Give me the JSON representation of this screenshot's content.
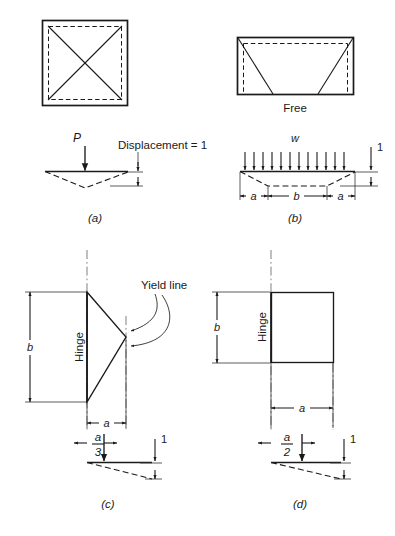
{
  "figure": {
    "panels": [
      {
        "id": "a",
        "caption": "(a)",
        "plan": {
          "shape": "square",
          "yield_pattern": "two full diagonals meeting at center",
          "edge_style": "supported on all four edges",
          "edge_labels": []
        },
        "section": {
          "load_label": "P",
          "load_type": "point load at center",
          "displacement_label": "Displacement = 1",
          "dimension_labels": []
        }
      },
      {
        "id": "b",
        "caption": "(b)",
        "plan": {
          "shape": "rectangle",
          "yield_pattern": "two inclined yield lines from top corners to bottom edge",
          "edge_style": "three edges supported, bottom edge free",
          "edge_labels": [
            "Free"
          ]
        },
        "section": {
          "load_label": "w",
          "load_type": "uniformly distributed load",
          "displacement_label": "1",
          "dimension_labels": [
            "a",
            "b",
            "a"
          ]
        }
      },
      {
        "id": "c",
        "caption": "(c)",
        "plan": {
          "shape": "triangle",
          "yield_pattern": "triangular yield line fan from hinge edge to apex",
          "edge_style": "hinged along left edge",
          "edge_labels": [
            "Hinge"
          ],
          "annotation": "Yield line",
          "dim_vertical": "b",
          "dim_horizontal": "a"
        },
        "section": {
          "centroid_numerator": "a",
          "centroid_denominator": "3",
          "displacement_label": "1"
        }
      },
      {
        "id": "d",
        "caption": "(d)",
        "plan": {
          "shape": "square",
          "yield_pattern": "rigid panel rotating about hinge edge",
          "edge_style": "hinged along left edge",
          "edge_labels": [
            "Hinge"
          ],
          "dim_vertical": "b",
          "dim_horizontal": "a"
        },
        "section": {
          "centroid_numerator": "a",
          "centroid_denominator": "2",
          "displacement_label": "1"
        }
      }
    ],
    "text": {
      "caption_a": "(a)",
      "caption_b": "(b)",
      "caption_c": "(c)",
      "caption_d": "(d)",
      "load_p": "P",
      "load_w": "w",
      "displacement_full": "Displacement = 1",
      "free_edge": "Free",
      "hinge_c": "Hinge",
      "hinge_d": "Hinge",
      "yield_line": "Yield line",
      "dim_a_left_b": "a",
      "dim_b_mid_b": "b",
      "dim_a_right_b": "a",
      "unit_one_b": "1",
      "dim_b_c": "b",
      "dim_a_c": "a",
      "frac_num_c": "a",
      "frac_den_c": "3",
      "unit_one_c": "1",
      "dim_b_d": "b",
      "dim_a_d": "a",
      "frac_num_d": "a",
      "frac_den_d": "2",
      "unit_one_d": "1"
    },
    "colors": {
      "line": "#1a1a1a",
      "thin_line": "#333333",
      "center_line": "#555555",
      "background": "#ffffff"
    }
  }
}
